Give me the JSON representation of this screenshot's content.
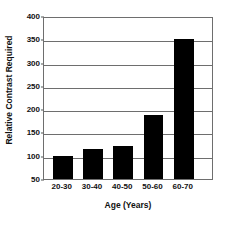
{
  "chart_data": {
    "type": "bar",
    "title": "",
    "xlabel": "Age (Years)",
    "ylabel": "Relative Contrast Required",
    "categories": [
      "20-30",
      "30-40",
      "40-50",
      "50-60",
      "60-70"
    ],
    "values": [
      100,
      115,
      120,
      187,
      351
    ],
    "ylim": [
      50,
      400
    ],
    "ytick_values": [
      50,
      100,
      150,
      200,
      250,
      300,
      350,
      400
    ],
    "ytick_labels": [
      "50",
      "100",
      "150",
      "200",
      "250",
      "300",
      "350",
      "400"
    ],
    "grid": true,
    "legend": false,
    "bar_color": "#000000",
    "grid_color": "#6e6e6e",
    "background_color": "#ffffff",
    "axis_color": "#6e6e6e"
  }
}
